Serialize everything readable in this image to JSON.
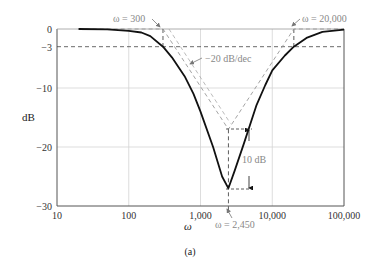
{
  "figure_label": "(a)",
  "chart_data": {
    "type": "line",
    "title": "",
    "xlabel": "ω",
    "ylabel": "dB",
    "xscale": "log",
    "xlim": [
      10,
      100000
    ],
    "ylim": [
      -30,
      0
    ],
    "x_ticks": [
      10,
      100,
      1000,
      10000,
      100000
    ],
    "x_tick_labels": [
      "10",
      "100",
      "1,000",
      "10,000",
      "100,000"
    ],
    "y_ticks": [
      0,
      -3,
      -10,
      -20,
      -30
    ],
    "y_tick_labels": [
      "0",
      "−3",
      "−10",
      "−20",
      "−30"
    ],
    "grid": true,
    "series": [
      {
        "name": "Band-stop (notch) magnitude response",
        "style": "solid-black",
        "x": [
          20,
          50,
          100,
          150,
          200,
          300,
          400,
          600,
          800,
          1000,
          1500,
          2000,
          2450,
          3000,
          4000,
          6000,
          8000,
          10000,
          15000,
          20000,
          30000,
          50000,
          100000
        ],
        "y": [
          0,
          -0.05,
          -0.3,
          -0.6,
          -1.2,
          -3,
          -4.8,
          -8,
          -11,
          -14,
          -20,
          -25,
          -27,
          -24,
          -19.5,
          -13,
          -9.5,
          -7,
          -4.5,
          -3,
          -1.5,
          -0.5,
          -0.1
        ]
      },
      {
        "name": "Asymptotic approximation",
        "style": "dashed-gray",
        "x": [
          20,
          300,
          2450,
          20000,
          100000
        ],
        "y": [
          0,
          0,
          -17,
          0,
          0
        ]
      }
    ],
    "reference_lines": [
      {
        "type": "horizontal",
        "y": -3,
        "style": "dashed"
      },
      {
        "type": "vertical",
        "x": 300,
        "y_range": [
          0,
          -3
        ],
        "style": "dashed"
      },
      {
        "type": "vertical",
        "x": 20000,
        "y_range": [
          0,
          -3
        ],
        "style": "dashed"
      },
      {
        "type": "vertical",
        "x": 2450,
        "y_range": [
          -17,
          -30
        ],
        "style": "dashed"
      }
    ],
    "annotations": [
      {
        "text": "ω = 300",
        "points_to": {
          "x": 300,
          "y": 0
        }
      },
      {
        "text": "ω = 20,000",
        "points_to": {
          "x": 20000,
          "y": 0
        }
      },
      {
        "text": "−20 dB/dec",
        "points_to": "descending asymptote"
      },
      {
        "text": "10 dB",
        "span": [
          -17,
          -27
        ],
        "at_x": 2450
      },
      {
        "text": "ω = 2,450",
        "points_to": {
          "x": 2450,
          "y": -30
        }
      }
    ]
  },
  "labels": {
    "ylabel": "dB",
    "xlabel": "ω",
    "ann_300": "ω = 300",
    "ann_20000": "ω = 20,000",
    "ann_slope": "−20 dB/dec",
    "ann_10db": "10 dB",
    "ann_2450": "ω = 2,450"
  }
}
